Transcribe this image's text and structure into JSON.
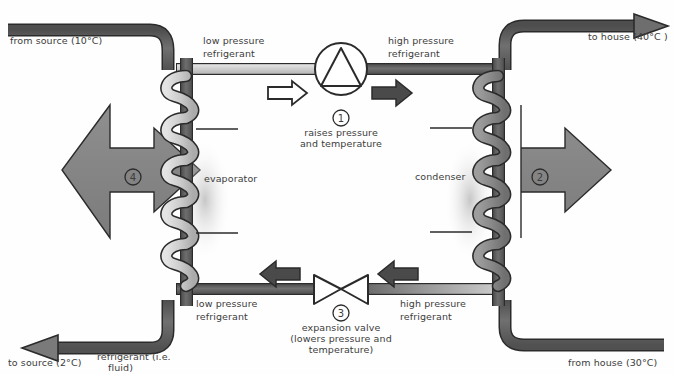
{
  "diagram": {
    "background_color": "#fefefe",
    "ink_color": "#3c3c3c"
  },
  "labels": {
    "from_source": "from source (10°C)",
    "to_house": "to house (40°C )",
    "to_source": "to source (2°C)",
    "from_house": "from house (30°C)",
    "low_pressure_top_line1": "low pressure",
    "low_pressure_top_line2": "refrigerant",
    "high_pressure_top_line1": "high pressure",
    "high_pressure_top_line2": "refrigerant",
    "low_pressure_bottom_line1": "low pressure",
    "low_pressure_bottom_line2": "refrigerant",
    "high_pressure_bottom_line1": "high pressure",
    "high_pressure_bottom_line2": "refrigerant",
    "evaporator": "evaporator",
    "condenser": "condenser",
    "refrigerant_note_line1": "refrigerant (i.e.",
    "refrigerant_note_line2": "fluid)"
  },
  "components": {
    "compressor": {
      "number": "1",
      "caption_line1": "raises pressure",
      "caption_line2": "and temperature",
      "shape": "circle-with-triangle"
    },
    "condenser_stage": {
      "number": "2",
      "shape": "large-right-arrow"
    },
    "expansion_valve": {
      "number": "3",
      "caption_line1": "expansion valve",
      "caption_line2": "(lowers pressure and",
      "caption_line3": "temperature)",
      "shape": "bowtie-valve"
    },
    "evaporator_stage": {
      "number": "4",
      "shape": "large-left-arrow"
    }
  },
  "colors": {
    "dark_pipe": "#5a5a5a",
    "light_pipe": "#c9c9c9",
    "coil_light": "#cfcfcf",
    "coil_dark": "#8d8d8d",
    "heat_arrow": "#8a8a8a",
    "outline": "#2b2b2b",
    "solid_arrow": "#4a4a4a",
    "hollow_arrow_fill": "#ffffff"
  },
  "flow_arrows": {
    "top_left": "hollow-right-arrow",
    "top_right": "solid-right-arrow",
    "bottom_left": "solid-left-arrow",
    "bottom_right": "solid-left-arrow"
  }
}
